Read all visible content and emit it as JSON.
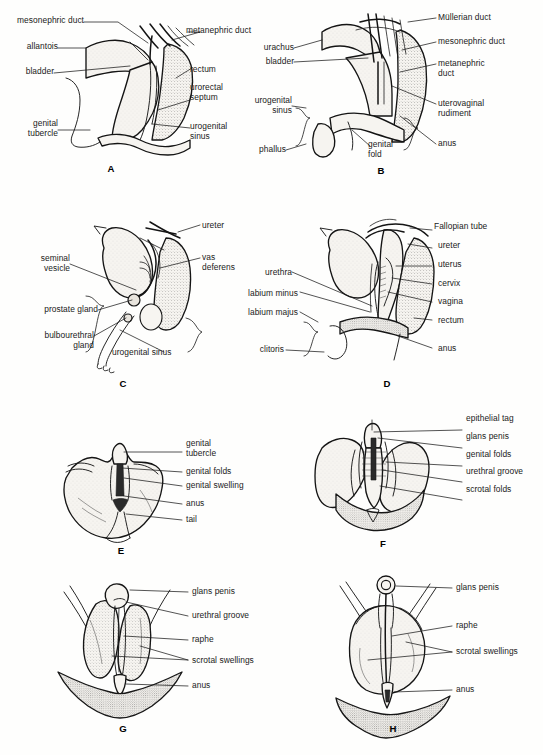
{
  "figure": {
    "type": "anatomical-illustration-plate",
    "panel_count": 8,
    "background_color": "#fefefd",
    "ink_color": "#111111",
    "panel_letters": [
      "A",
      "B",
      "C",
      "D",
      "E",
      "F",
      "G",
      "H"
    ]
  },
  "panels": {
    "A": {
      "letter": "A",
      "labels_left": [
        {
          "text": "mesonephric duct"
        },
        {
          "text": "allantois"
        },
        {
          "text": "bladder"
        },
        {
          "text": "genital\ntubercle"
        }
      ],
      "labels_right": [
        {
          "text": "metanephric duct"
        },
        {
          "text": "rectum"
        },
        {
          "text": "urorectal\nseptum"
        },
        {
          "text": "urogenital\nsinus"
        }
      ]
    },
    "B": {
      "letter": "B",
      "labels_left": [
        {
          "text": "urachus"
        },
        {
          "text": "bladder"
        },
        {
          "text": "urogenital\nsinus"
        },
        {
          "text": "phallus"
        },
        {
          "text": "genital\nfold"
        }
      ],
      "labels_right": [
        {
          "text": "Müllerian duct"
        },
        {
          "text": "mesonephric duct"
        },
        {
          "text": "metanephric\nduct"
        },
        {
          "text": "uterovaginal\nrudiment"
        },
        {
          "text": "anus"
        }
      ]
    },
    "C": {
      "letter": "C",
      "labels_left": [
        {
          "text": "seminal\nvesicle"
        },
        {
          "text": "prostate gland"
        },
        {
          "text": "bulbourethral\ngland"
        }
      ],
      "labels_right": [
        {
          "text": "ureter"
        },
        {
          "text": "vas\ndeferens"
        },
        {
          "text": "urogenital sinus"
        }
      ]
    },
    "D": {
      "letter": "D",
      "labels_left": [
        {
          "text": "urethra"
        },
        {
          "text": "labium minus"
        },
        {
          "text": "labium majus"
        },
        {
          "text": "clitoris"
        }
      ],
      "labels_right": [
        {
          "text": "Fallopian tube"
        },
        {
          "text": "ureter"
        },
        {
          "text": "uterus"
        },
        {
          "text": "cervix"
        },
        {
          "text": "vagina"
        },
        {
          "text": "rectum"
        },
        {
          "text": "anus"
        }
      ]
    },
    "E": {
      "letter": "E",
      "labels_right": [
        {
          "text": "genital\ntubercle"
        },
        {
          "text": "genital folds"
        },
        {
          "text": "genital swelling"
        },
        {
          "text": "anus"
        },
        {
          "text": "tail"
        }
      ]
    },
    "F": {
      "letter": "F",
      "labels_right": [
        {
          "text": "epithelial tag"
        },
        {
          "text": "glans penis"
        },
        {
          "text": "genital folds"
        },
        {
          "text": "urethral groove"
        },
        {
          "text": "scrotal folds"
        }
      ]
    },
    "G": {
      "letter": "G",
      "labels_right": [
        {
          "text": "glans penis"
        },
        {
          "text": "urethral groove"
        },
        {
          "text": "raphe"
        },
        {
          "text": "scrotal swellings"
        },
        {
          "text": "anus"
        }
      ]
    },
    "H": {
      "letter": "H",
      "labels_right": [
        {
          "text": "glans penis"
        },
        {
          "text": "raphe"
        },
        {
          "text": "scrotal swellings"
        },
        {
          "text": "anus"
        }
      ]
    }
  }
}
